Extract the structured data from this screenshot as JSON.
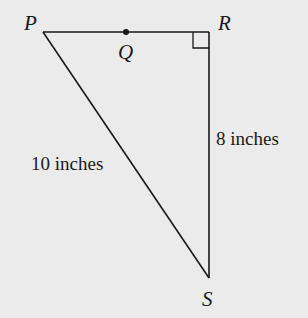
{
  "diagram": {
    "type": "right-triangle",
    "background_color": "#ebebeb",
    "stroke_color": "#1a1a1a",
    "vertices": {
      "P": {
        "label": "P",
        "x": 43,
        "y": 32
      },
      "R": {
        "label": "R",
        "x": 209,
        "y": 32
      },
      "S": {
        "label": "S",
        "x": 209,
        "y": 278
      }
    },
    "points": {
      "Q": {
        "label": "Q",
        "x": 126,
        "y": 32,
        "on_segment": "PR"
      }
    },
    "right_angle_at": "R",
    "sides": {
      "PS": {
        "label": "10 inches"
      },
      "RS": {
        "label": "8 inches"
      }
    }
  }
}
